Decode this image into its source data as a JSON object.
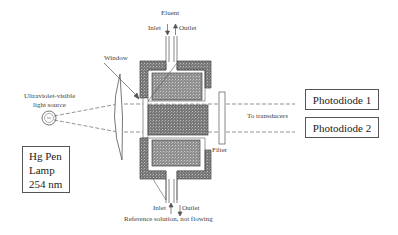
{
  "diagram": {
    "type": "schematic",
    "title": "",
    "labels": {
      "eluent": "Eluent",
      "top_inlet": "Inlet",
      "top_outlet": "Outlet",
      "window": "Window",
      "light_source": "Ultraviolet-visible light source",
      "light_source_line1": "Ultraviolet-visible",
      "light_source_line2": "light source",
      "filter": "Filter",
      "to_transducers": "To transducers",
      "bottom_inlet": "Inlet",
      "bottom_outlet": "Outlet",
      "reference": "Reference solution, not flowing"
    },
    "lamp_box": {
      "line1": "Hg Pen",
      "line2": "Lamp",
      "line3": "254 nm"
    },
    "photodiodes": [
      {
        "label": "Photodiode 1"
      },
      {
        "label": "Photodiode 2"
      }
    ],
    "colors": {
      "line": "#555555",
      "fill_dark": "#6b6b6b",
      "fill_light": "#8a8a8a",
      "background": "#ffffff"
    }
  }
}
